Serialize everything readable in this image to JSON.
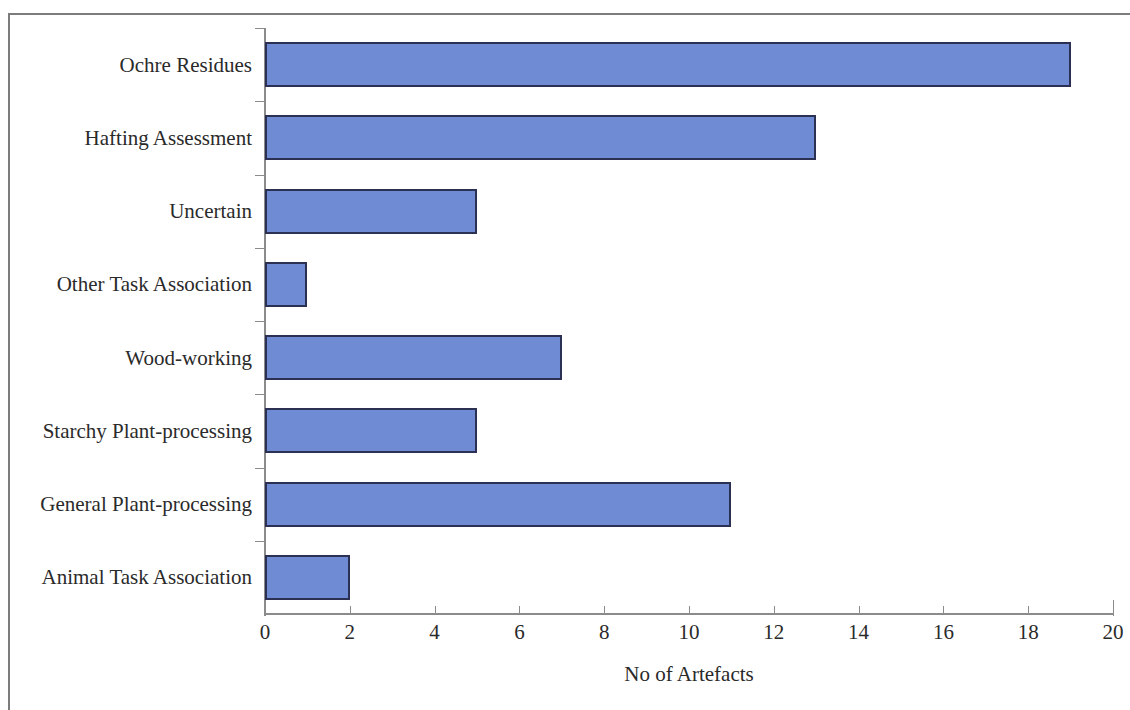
{
  "chart_data": {
    "type": "bar",
    "orientation": "horizontal",
    "title": "",
    "xlabel": "No of Artefacts",
    "ylabel": "",
    "xlim": [
      0,
      20
    ],
    "xticks": [
      0,
      2,
      4,
      6,
      8,
      10,
      12,
      14,
      16,
      18,
      20
    ],
    "grid": false,
    "legend": false,
    "bar_color": "#6e8bd4",
    "bar_border_color": "#2c3154",
    "axis_color": "#8b8b8b",
    "categories": [
      "Ochre Residues",
      "Hafting Assessment",
      "Uncertain",
      "Other Task Association",
      "Wood-working",
      "Starchy Plant-processing",
      "General Plant-processing",
      "Animal Task Association"
    ],
    "values": [
      19,
      13,
      5,
      1,
      7,
      5,
      11,
      2
    ]
  }
}
